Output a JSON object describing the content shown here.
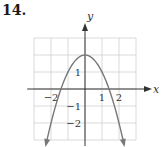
{
  "problem": {
    "number": "14."
  },
  "chart_data": {
    "type": "line",
    "title": "",
    "xlabel": "x",
    "ylabel": "y",
    "xlim": [
      -3,
      3
    ],
    "ylim": [
      -3,
      3
    ],
    "grid": true,
    "x_ticks": [
      {
        "value": -2,
        "label": "−2"
      },
      {
        "value": 1,
        "label": "1"
      },
      {
        "value": 2,
        "label": "2"
      }
    ],
    "y_ticks": [
      {
        "value": 1,
        "label": "1"
      },
      {
        "value": -1,
        "label": "−1"
      },
      {
        "value": -2,
        "label": "−2"
      }
    ],
    "series": [
      {
        "name": "y = 2 - x^2",
        "equation": "y = 2 - x^2",
        "vertex": [
          0,
          2
        ],
        "x_intercepts": [
          -1.414,
          1.414
        ],
        "x": [
          -2.3,
          -2,
          -1.5,
          -1,
          -0.5,
          0,
          0.5,
          1,
          1.5,
          2,
          2.3
        ],
        "values": [
          -3.29,
          -2,
          -0.25,
          1,
          1.75,
          2,
          1.75,
          1,
          -0.25,
          -2,
          -3.29
        ],
        "arrows_at_ends": true
      }
    ],
    "colors": {
      "curve": "#777777",
      "grid": "#d0d0d0",
      "axis": "#333333"
    }
  }
}
